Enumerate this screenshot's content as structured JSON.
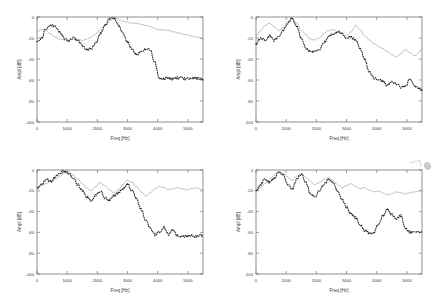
{
  "figure": {
    "title": "",
    "layout": "2x2 subplot grid",
    "background": "#ffffff",
    "axis_color": "#555555",
    "annotation_mark": "smudge-artifact"
  },
  "styles": {
    "solid_line_color": "#8a8a8a",
    "dotted_line_color": "#2a2a2a",
    "frame_color": "#606060",
    "text_color": "#3a3a3a"
  },
  "axes_common": {
    "xlabel": "Freq [Hz]",
    "ylabel": "Ampl [dB]",
    "xticks": [
      "0",
      "1000",
      "2000",
      "3000",
      "4000",
      "5000"
    ],
    "yticks": [
      "0",
      "-20",
      "-40",
      "-60",
      "-80",
      "-100"
    ],
    "xlim": [
      0,
      5500
    ],
    "ylim": [
      -100,
      0
    ],
    "grid": false,
    "legend": "none"
  },
  "chart_data": [
    {
      "type": "line",
      "name": "subplot-top-left",
      "title": "",
      "xlabel": "Freq [Hz]",
      "ylabel": "Ampl [dB]",
      "xlim": [
        0,
        5500
      ],
      "ylim": [
        -100,
        0
      ],
      "xticks": [
        0,
        1000,
        2000,
        3000,
        4000,
        5000
      ],
      "yticks": [
        0,
        -20,
        -40,
        -60,
        -80,
        -100
      ],
      "grid": false,
      "series": [
        {
          "name": "model-response",
          "style": "solid",
          "color": "#8a8a8a",
          "x": [
            0,
            150,
            300,
            450,
            600,
            750,
            900,
            1050,
            1200,
            1350,
            1500,
            1650,
            1800,
            1950,
            2100,
            2250,
            2400,
            2550,
            2700,
            2850,
            3000,
            3150,
            3300,
            3450,
            3600,
            3750,
            3900,
            4050,
            4200,
            4350,
            4500,
            4650,
            4800,
            4950,
            5100,
            5250,
            5400,
            5500
          ],
          "values": [
            -14,
            -12,
            -13,
            -16,
            -19,
            -21,
            -22,
            -22,
            -21,
            -21,
            -22,
            -21,
            -19,
            -16,
            -12,
            -8,
            -4,
            -1,
            -2,
            -4,
            -5,
            -6,
            -6,
            -7,
            -8,
            -9,
            -11,
            -12,
            -12,
            -13,
            -14,
            -15,
            -16,
            -17,
            -18,
            -19,
            -20,
            -21
          ]
        },
        {
          "name": "measured-response",
          "style": "dotted",
          "color": "#2a2a2a",
          "x": [
            0,
            150,
            300,
            450,
            600,
            750,
            900,
            1050,
            1200,
            1350,
            1500,
            1650,
            1800,
            1950,
            2100,
            2250,
            2400,
            2550,
            2700,
            2850,
            3000,
            3150,
            3300,
            3450,
            3600,
            3750,
            3900,
            4050,
            4200,
            4350,
            4500,
            4650,
            4800,
            4950,
            5100,
            5250,
            5400,
            5500
          ],
          "values": [
            -24,
            -20,
            -11,
            -8,
            -9,
            -14,
            -20,
            -23,
            -20,
            -22,
            -27,
            -31,
            -30,
            -24,
            -16,
            -8,
            -2,
            -1,
            -8,
            -16,
            -24,
            -31,
            -36,
            -33,
            -30,
            -31,
            -43,
            -58,
            -59,
            -58,
            -59,
            -58,
            -58,
            -59,
            -58,
            -58,
            -59,
            -60
          ]
        }
      ]
    },
    {
      "type": "line",
      "name": "subplot-top-right",
      "title": "",
      "xlabel": "Freq [Hz]",
      "ylabel": "Ampl [dB]",
      "xlim": [
        0,
        5500
      ],
      "ylim": [
        -100,
        0
      ],
      "xticks": [
        0,
        1000,
        2000,
        3000,
        4000,
        5000
      ],
      "yticks": [
        0,
        -20,
        -40,
        -60,
        -80,
        -100
      ],
      "grid": false,
      "series": [
        {
          "name": "model-response",
          "style": "solid",
          "color": "#8a8a8a",
          "x": [
            0,
            150,
            300,
            450,
            600,
            750,
            900,
            1050,
            1200,
            1350,
            1500,
            1650,
            1800,
            1950,
            2100,
            2250,
            2400,
            2550,
            2700,
            2850,
            3000,
            3150,
            3300,
            3450,
            3600,
            3750,
            3900,
            4050,
            4200,
            4350,
            4500,
            4650,
            4800,
            4950,
            5100,
            5250,
            5400,
            5500
          ],
          "values": [
            -18,
            -13,
            -8,
            -6,
            -9,
            -13,
            -10,
            -4,
            -2,
            -6,
            -12,
            -17,
            -21,
            -22,
            -20,
            -16,
            -13,
            -12,
            -14,
            -16,
            -18,
            -14,
            -8,
            -12,
            -18,
            -22,
            -25,
            -28,
            -30,
            -33,
            -36,
            -38,
            -35,
            -31,
            -34,
            -37,
            -34,
            -30
          ]
        },
        {
          "name": "measured-response",
          "style": "dotted",
          "color": "#2a2a2a",
          "x": [
            0,
            150,
            300,
            450,
            600,
            750,
            900,
            1050,
            1200,
            1350,
            1500,
            1650,
            1800,
            1950,
            2100,
            2250,
            2400,
            2550,
            2700,
            2850,
            3000,
            3150,
            3300,
            3450,
            3600,
            3750,
            3900,
            4050,
            4200,
            4350,
            4500,
            4650,
            4800,
            4950,
            5100,
            5250,
            5400,
            5500
          ],
          "values": [
            -26,
            -20,
            -22,
            -18,
            -22,
            -19,
            -13,
            -6,
            -1,
            -9,
            -20,
            -30,
            -33,
            -32,
            -31,
            -24,
            -19,
            -16,
            -14,
            -16,
            -20,
            -19,
            -22,
            -30,
            -40,
            -52,
            -58,
            -60,
            -61,
            -65,
            -62,
            -64,
            -67,
            -66,
            -59,
            -66,
            -68,
            -70
          ]
        }
      ]
    },
    {
      "type": "line",
      "name": "subplot-bottom-left",
      "title": "",
      "xlabel": "Freq [Hz]",
      "ylabel": "Ampl [dB]",
      "xlim": [
        0,
        5500
      ],
      "ylim": [
        -100,
        0
      ],
      "xticks": [
        0,
        1000,
        2000,
        3000,
        4000,
        5000
      ],
      "yticks": [
        0,
        -20,
        -40,
        -60,
        -80,
        -100
      ],
      "grid": false,
      "series": [
        {
          "name": "model-response",
          "style": "solid",
          "color": "#8a8a8a",
          "x": [
            0,
            150,
            300,
            450,
            600,
            750,
            900,
            1050,
            1200,
            1350,
            1500,
            1650,
            1800,
            1950,
            2100,
            2250,
            2400,
            2550,
            2700,
            2850,
            3000,
            3150,
            3300,
            3450,
            3600,
            3750,
            3900,
            4050,
            4200,
            4350,
            4500,
            4650,
            4800,
            4950,
            5100,
            5250,
            5400,
            5500
          ],
          "values": [
            -16,
            -15,
            -13,
            -11,
            -9,
            -6,
            -3,
            -2,
            -5,
            -9,
            -13,
            -17,
            -20,
            -16,
            -12,
            -15,
            -19,
            -22,
            -19,
            -14,
            -10,
            -12,
            -16,
            -21,
            -25,
            -22,
            -18,
            -16,
            -17,
            -19,
            -18,
            -17,
            -18,
            -19,
            -18,
            -17,
            -18,
            -19
          ]
        },
        {
          "name": "measured-response",
          "style": "dotted",
          "color": "#2a2a2a",
          "x": [
            0,
            150,
            300,
            450,
            600,
            750,
            900,
            1050,
            1200,
            1350,
            1500,
            1650,
            1800,
            1950,
            2100,
            2250,
            2400,
            2550,
            2700,
            2850,
            3000,
            3150,
            3300,
            3450,
            3600,
            3750,
            3900,
            4050,
            4200,
            4350,
            4500,
            4650,
            4800,
            4950,
            5100,
            5250,
            5400,
            5500
          ],
          "values": [
            -18,
            -14,
            -9,
            -11,
            -7,
            -3,
            -1,
            -3,
            -8,
            -14,
            -20,
            -26,
            -30,
            -24,
            -20,
            -27,
            -29,
            -25,
            -22,
            -18,
            -14,
            -20,
            -28,
            -38,
            -48,
            -56,
            -62,
            -60,
            -55,
            -62,
            -58,
            -63,
            -64,
            -64,
            -63,
            -64,
            -63,
            -63
          ]
        }
      ]
    },
    {
      "type": "line",
      "name": "subplot-bottom-right",
      "title": "",
      "xlabel": "Freq [Hz]",
      "ylabel": "Ampl [dB]",
      "xlim": [
        0,
        5500
      ],
      "ylim": [
        -100,
        0
      ],
      "xticks": [
        0,
        1000,
        2000,
        3000,
        4000,
        5000
      ],
      "yticks": [
        0,
        -20,
        -40,
        -60,
        -80,
        -100
      ],
      "grid": false,
      "series": [
        {
          "name": "model-response",
          "style": "solid",
          "color": "#8a8a8a",
          "x": [
            0,
            150,
            300,
            450,
            600,
            750,
            900,
            1050,
            1200,
            1350,
            1500,
            1650,
            1800,
            1950,
            2100,
            2250,
            2400,
            2550,
            2700,
            2850,
            3000,
            3150,
            3300,
            3450,
            3600,
            3750,
            3900,
            4050,
            4200,
            4350,
            4500,
            4650,
            4800,
            4950,
            5100,
            5250,
            5400,
            5500
          ],
          "values": [
            -20,
            -17,
            -13,
            -9,
            -5,
            -2,
            -3,
            -7,
            -10,
            -6,
            -3,
            -7,
            -11,
            -14,
            -12,
            -9,
            -7,
            -10,
            -14,
            -17,
            -15,
            -13,
            -16,
            -18,
            -17,
            -19,
            -21,
            -20,
            -22,
            -24,
            -23,
            -21,
            -22,
            -23,
            -22,
            -21,
            -20,
            -20
          ]
        },
        {
          "name": "measured-response",
          "style": "dotted",
          "color": "#2a2a2a",
          "x": [
            0,
            150,
            300,
            450,
            600,
            750,
            900,
            1050,
            1200,
            1350,
            1500,
            1650,
            1800,
            1950,
            2100,
            2250,
            2400,
            2550,
            2700,
            2850,
            3000,
            3150,
            3300,
            3450,
            3600,
            3750,
            3900,
            4050,
            4200,
            4350,
            4500,
            4650,
            4800,
            4950,
            5100,
            5250,
            5400,
            5500
          ],
          "values": [
            -21,
            -14,
            -9,
            -12,
            -8,
            -2,
            -5,
            -14,
            -18,
            -9,
            -4,
            -12,
            -22,
            -26,
            -20,
            -14,
            -9,
            -12,
            -20,
            -28,
            -36,
            -42,
            -46,
            -52,
            -58,
            -61,
            -60,
            -52,
            -44,
            -38,
            -43,
            -47,
            -44,
            -56,
            -60,
            -59,
            -60,
            -59
          ]
        }
      ]
    }
  ]
}
